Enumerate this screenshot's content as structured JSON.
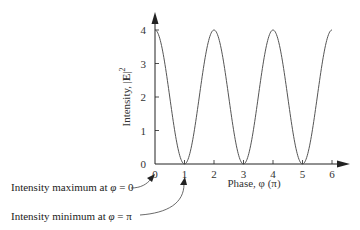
{
  "chart_data": {
    "type": "line",
    "title": "",
    "xlabel": "Phase, φ (π)",
    "ylabel_prefix": "Intensity, |",
    "ylabel_bold": "E",
    "ylabel_suffix": "|",
    "ylabel_sup": "2",
    "xlim": [
      0,
      6
    ],
    "ylim": [
      0,
      4
    ],
    "xticks": [
      "0",
      "1",
      "2",
      "3",
      "4",
      "5",
      "6"
    ],
    "yticks": [
      "0",
      "1",
      "2",
      "3",
      "4"
    ],
    "grid": false,
    "legend": null,
    "series": [
      {
        "name": "Intensity",
        "function": "4*cos^2(pi*phi/2)",
        "x": [
          0,
          0.5,
          1,
          1.5,
          2,
          2.5,
          3,
          3.5,
          4,
          4.5,
          5,
          5.5,
          6
        ],
        "values": [
          4,
          2,
          0,
          2,
          4,
          2,
          0,
          2,
          4,
          2,
          0,
          2,
          4
        ]
      }
    ],
    "annotations": [
      {
        "text_prefix": "Intensity maximum at ",
        "symbol": "φ",
        "text_suffix": " = 0",
        "points_to_x": 0
      },
      {
        "text_prefix": "Intensity minimum at ",
        "symbol": "φ",
        "text_suffix": " = π",
        "points_to_x": 1
      }
    ]
  },
  "colors": {
    "axis": "#222222",
    "curve": "#555555",
    "text": "#333333"
  }
}
